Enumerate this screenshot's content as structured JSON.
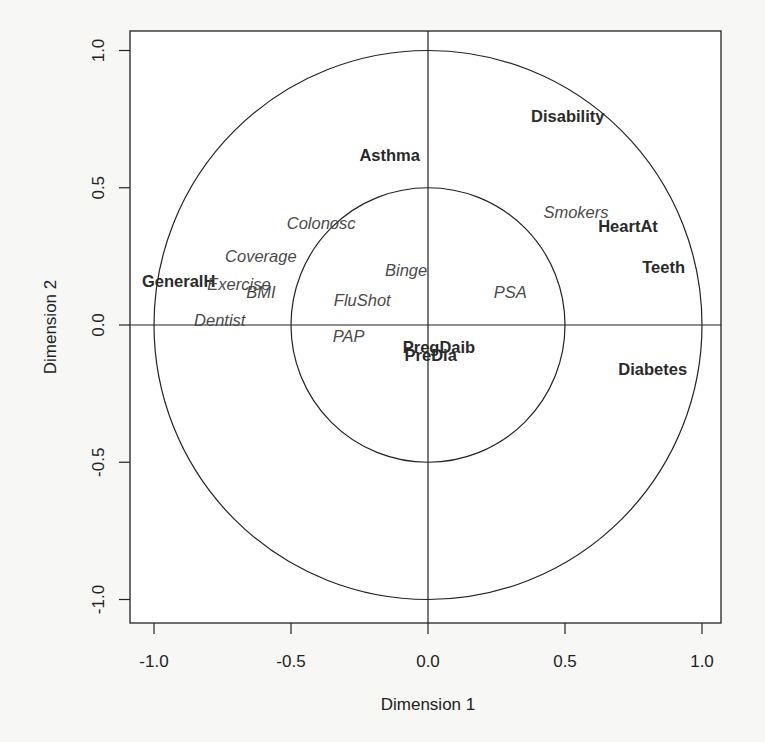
{
  "chart_data": {
    "type": "scatter",
    "title": "",
    "xlabel": "Dimension  1",
    "ylabel": "Dimension  2",
    "xlim": [
      -1.07,
      1.08
    ],
    "ylim": [
      -1.08,
      1.08
    ],
    "x_ticks": [
      -1.0,
      -0.5,
      0.0,
      0.5,
      1.0
    ],
    "x_tick_labels": [
      "-1.0",
      "-0.5",
      "0.0",
      "0.5",
      "1.0"
    ],
    "y_ticks": [
      -1.0,
      -0.5,
      0.0,
      0.5,
      1.0
    ],
    "y_tick_labels": [
      "-1.0",
      "-0.5",
      "0.0",
      "0.5",
      "1.0"
    ],
    "grid": false,
    "legend": null,
    "reference_lines": {
      "horizontal": 0.0,
      "vertical": 0.0
    },
    "circles": [
      {
        "name": "outer-circle",
        "radius": 1.0
      },
      {
        "name": "inner-circle",
        "radius": 0.5
      }
    ],
    "points": [
      {
        "label": "Disability",
        "x": 0.51,
        "y": 0.76,
        "style": "bold"
      },
      {
        "label": "Asthma",
        "x": -0.14,
        "y": 0.62,
        "style": "bold"
      },
      {
        "label": "Smokers",
        "x": 0.54,
        "y": 0.41,
        "style": "italic"
      },
      {
        "label": "HeartAt",
        "x": 0.73,
        "y": 0.36,
        "style": "bold"
      },
      {
        "label": "Colonosc",
        "x": -0.39,
        "y": 0.37,
        "style": "italic"
      },
      {
        "label": "Coverage",
        "x": -0.61,
        "y": 0.25,
        "style": "italic"
      },
      {
        "label": "Teeth",
        "x": 0.86,
        "y": 0.21,
        "style": "bold"
      },
      {
        "label": "Binge",
        "x": -0.08,
        "y": 0.2,
        "style": "italic"
      },
      {
        "label": "GeneralH",
        "x": -0.91,
        "y": 0.16,
        "style": "bold"
      },
      {
        "label": "Exercise",
        "x": -0.69,
        "y": 0.15,
        "style": "italic"
      },
      {
        "label": "BMI",
        "x": -0.61,
        "y": 0.12,
        "style": "italic"
      },
      {
        "label": "PSA",
        "x": 0.3,
        "y": 0.12,
        "style": "italic"
      },
      {
        "label": "FluShot",
        "x": -0.24,
        "y": 0.09,
        "style": "italic"
      },
      {
        "label": "Dentist",
        "x": -0.76,
        "y": 0.02,
        "style": "italic"
      },
      {
        "label": "PAP",
        "x": -0.29,
        "y": -0.04,
        "style": "italic"
      },
      {
        "label": "PregDaib",
        "x": 0.04,
        "y": -0.08,
        "style": "bold"
      },
      {
        "label": "PreDia",
        "x": 0.01,
        "y": -0.11,
        "style": "bold"
      },
      {
        "label": "Diabetes",
        "x": 0.82,
        "y": -0.16,
        "style": "bold"
      }
    ]
  },
  "colors": {
    "background": "#f7f7f5",
    "plot_background": "#ffffff",
    "axis_line": "#222222",
    "bold_label": "#2a2a2a",
    "italic_label": "#4a4a4a"
  }
}
